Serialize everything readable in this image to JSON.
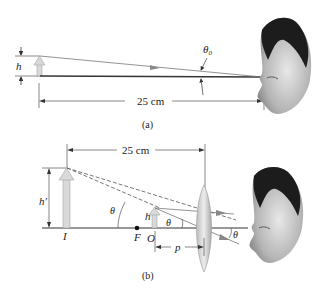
{
  "figure_a": {
    "caption": "(a)",
    "height_label": "h",
    "angle_label": "θ",
    "angle_subscript": "0",
    "distance_label": "25 cm"
  },
  "figure_b": {
    "caption": "(b)",
    "distance_label": "25 cm",
    "image_height_label": "h′",
    "object_height_label": "h",
    "image_label": "I",
    "focal_label": "F",
    "object_label": "O",
    "object_distance_label": "p",
    "angle_label_left": "θ",
    "angle_label_mid": "θ",
    "angle_label_right": "θ"
  },
  "colors": {
    "line": "#333333",
    "arrow_fill": "#d9d9d9",
    "lens": "#c8c8c8",
    "ray": "#777777"
  }
}
